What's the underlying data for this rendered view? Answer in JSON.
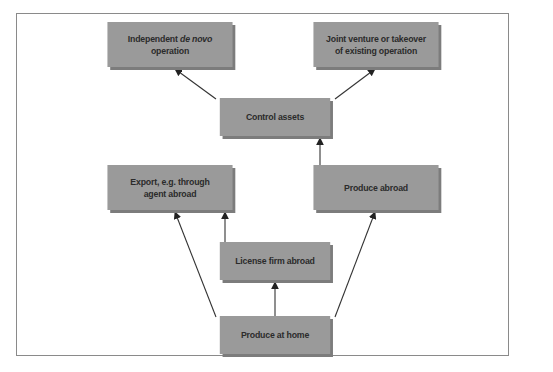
{
  "diagram": {
    "nodes": [
      {
        "id": "independent",
        "line1_prefix": "Independent ",
        "line1_italic": "de novo",
        "line2": "operation"
      },
      {
        "id": "joint",
        "line1": "Joint venture or takeover",
        "line2": "of existing operation"
      },
      {
        "id": "control",
        "label": "Control assets"
      },
      {
        "id": "export",
        "line1": "Export, e.g. through",
        "line2": "agent abroad"
      },
      {
        "id": "produce_abroad",
        "label": "Produce abroad"
      },
      {
        "id": "license",
        "label": "License firm abroad"
      },
      {
        "id": "produce_home",
        "label": "Produce at home"
      }
    ],
    "edges": [
      {
        "from": "produce_home",
        "to": "export"
      },
      {
        "from": "produce_home",
        "to": "license"
      },
      {
        "from": "produce_home",
        "to": "produce_abroad"
      },
      {
        "from": "license",
        "to": "export"
      },
      {
        "from": "produce_abroad",
        "to": "control"
      },
      {
        "from": "control",
        "to": "independent"
      },
      {
        "from": "control",
        "to": "joint"
      }
    ],
    "colors": {
      "box": "#9a9a9a",
      "box_shadow": "#7c7c7c",
      "text": "#2b2b2b",
      "line": "#333333",
      "frame": "#8a8a8a"
    }
  }
}
